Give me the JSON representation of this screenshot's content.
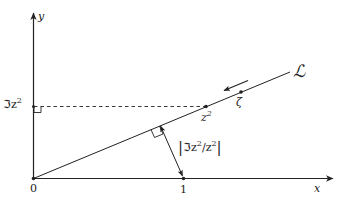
{
  "diagram": {
    "axes": {
      "x_label": "x",
      "y_label": "y",
      "origin_label": "0",
      "unit_label": "1"
    },
    "line": {
      "label": "ℒ",
      "direction": "toward origin"
    },
    "points": {
      "z_squared": {
        "base": "z",
        "sup": "2"
      },
      "zeta": "ζ"
    },
    "imag_part_label": {
      "prefix": "ℑz",
      "sup": "2"
    },
    "distance_label": {
      "bar_left": "|",
      "a": "ℑz",
      "a_sup": "2",
      "slash": "/z",
      "b_sup": "2",
      "bar_right": "|"
    },
    "colors": {
      "ink": "#222222",
      "background": "#ffffff"
    }
  }
}
